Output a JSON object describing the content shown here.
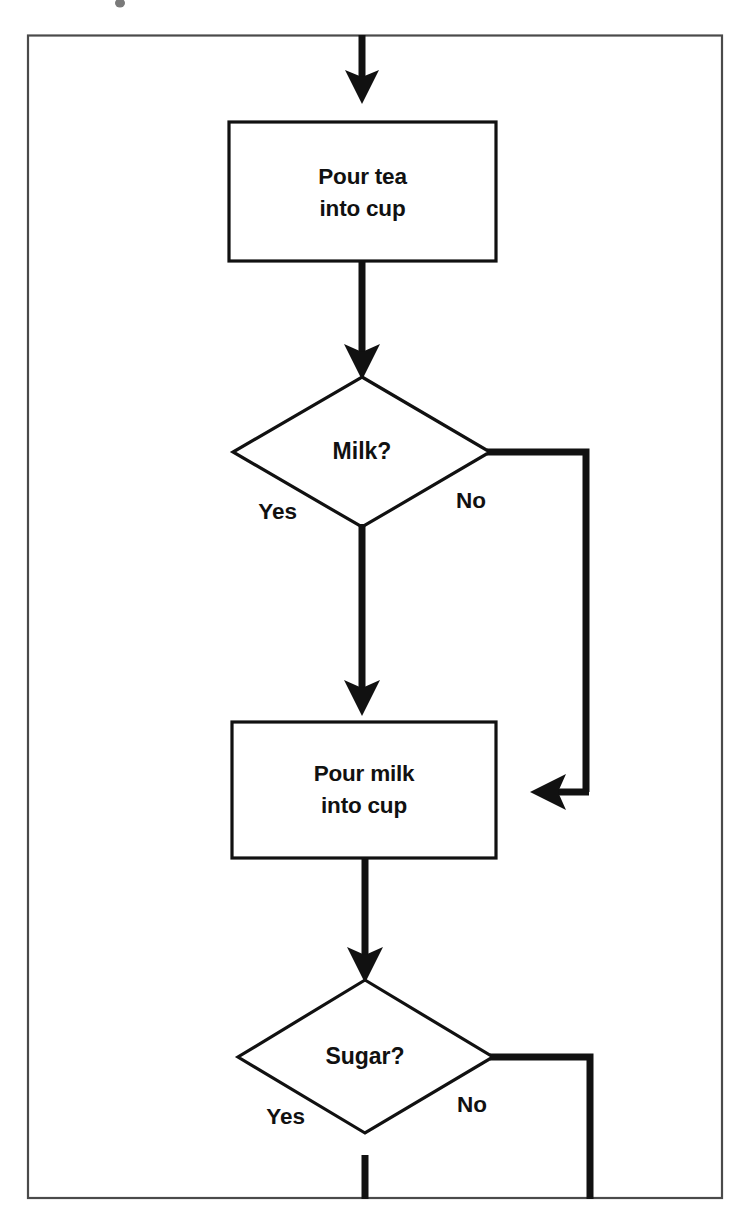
{
  "diagram": {
    "type": "flowchart",
    "background_color": "#ffffff",
    "line_color": "#111111",
    "border_color": "#4a4a4a",
    "nodes": [
      {
        "id": "pour-tea",
        "shape": "process",
        "line1": "Pour tea",
        "line2": "into cup"
      },
      {
        "id": "milk-decision",
        "shape": "decision",
        "label": "Milk?",
        "yes_label": "Yes",
        "no_label": "No"
      },
      {
        "id": "pour-milk",
        "shape": "process",
        "line1": "Pour milk",
        "line2": "into cup"
      },
      {
        "id": "sugar-decision",
        "shape": "decision",
        "label": "Sugar?",
        "yes_label": "Yes",
        "no_label": "No"
      }
    ],
    "edges": [
      {
        "id": "entry-to-tea",
        "from": "top-edge",
        "to": "pour-tea",
        "label": ""
      },
      {
        "id": "tea-to-milk",
        "from": "pour-tea",
        "to": "milk-decision",
        "label": ""
      },
      {
        "id": "milk-yes",
        "from": "milk-decision",
        "to": "pour-milk",
        "label": "Yes"
      },
      {
        "id": "milk-no",
        "from": "milk-decision",
        "to": "pour-milk-bypass",
        "label": "No"
      },
      {
        "id": "milk-to-sugar",
        "from": "pour-milk",
        "to": "sugar-decision",
        "label": ""
      },
      {
        "id": "sugar-yes",
        "from": "sugar-decision",
        "to": "bottom-edge",
        "label": "Yes"
      },
      {
        "id": "sugar-no",
        "from": "sugar-decision",
        "to": "bottom-edge",
        "label": "No"
      }
    ]
  }
}
